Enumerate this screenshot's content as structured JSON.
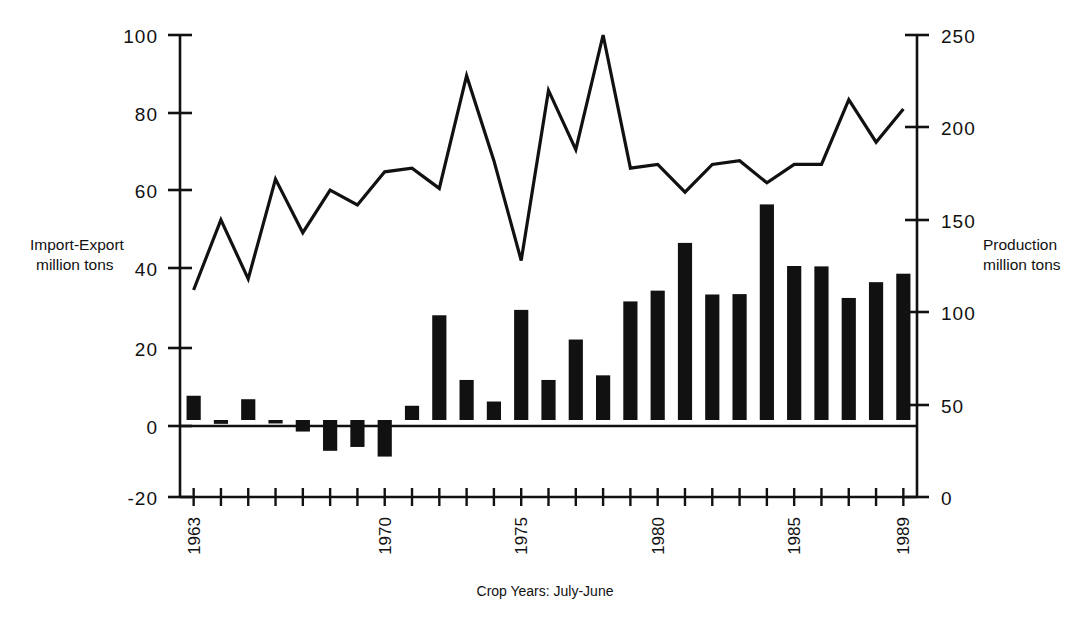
{
  "chart_data": {
    "type": "bar",
    "title": "",
    "xlabel": "Crop Years: July-June",
    "left_axis": {
      "label_line1": "Import-Export",
      "label_line2": "million tons",
      "ticks": [
        "-20",
        "0",
        "20",
        "40",
        "60",
        "80",
        "100"
      ],
      "ylim": [
        -20,
        100
      ],
      "unit": "million tons"
    },
    "right_axis": {
      "label_line1": "Production",
      "label_line2": "million tons",
      "ticks": [
        "0",
        "50",
        "100",
        "150",
        "200",
        "250"
      ],
      "ylim": [
        0,
        250
      ],
      "unit": "million tons"
    },
    "x": [
      1963,
      1964,
      1965,
      1966,
      1967,
      1968,
      1969,
      1970,
      1971,
      1972,
      1973,
      1974,
      1975,
      1976,
      1977,
      1978,
      1979,
      1980,
      1981,
      1982,
      1983,
      1984,
      1985,
      1986,
      1987,
      1988,
      1989
    ],
    "xtick_labels": [
      "1963",
      "1970",
      "1975",
      "1980",
      "1985",
      "1989"
    ],
    "xtick_values": [
      1963,
      1970,
      1975,
      1980,
      1985,
      1989
    ],
    "grid": false,
    "legend": "none",
    "series": [
      {
        "name": "Import-Export",
        "type": "bar",
        "axis": "left",
        "color": "#111111",
        "values": [
          6.3,
          -1.0,
          5.4,
          -0.9,
          -3.0,
          -8.0,
          -7.0,
          -9.5,
          3.7,
          27.2,
          10.4,
          4.8,
          28.6,
          10.4,
          20.9,
          11.6,
          30.8,
          33.6,
          46.0,
          32.6,
          32.7,
          56.0,
          40.0,
          39.9,
          31.7,
          35.8,
          38.0
        ]
      },
      {
        "name": "Production",
        "type": "line",
        "axis": "right",
        "color": "#111111",
        "values": [
          112,
          150,
          118,
          172,
          143,
          166,
          158,
          176,
          178,
          167,
          228,
          182,
          128,
          220,
          188,
          250,
          178,
          180,
          165,
          180,
          182,
          170,
          180,
          180,
          215,
          192,
          210
        ]
      }
    ]
  },
  "axes": {
    "left_tick_0": "0",
    "left_tick_20": "20",
    "left_tick_40": "40",
    "left_tick_60": "60",
    "left_tick_80": "80",
    "left_tick_100": "100",
    "left_tick_neg20": "-20",
    "right_tick_0": "0",
    "right_tick_50": "50",
    "right_tick_100": "100",
    "right_tick_150": "150",
    "right_tick_200": "200",
    "right_tick_250": "250",
    "left_title_l1": "Import-Export",
    "left_title_l2": "million tons",
    "right_title_l1": "Production",
    "right_title_l2": "million tons",
    "x_title": "Crop Years: July-June",
    "x_1963": "1963",
    "x_1970": "1970",
    "x_1975": "1975",
    "x_1980": "1980",
    "x_1985": "1985",
    "x_1989": "1989"
  }
}
